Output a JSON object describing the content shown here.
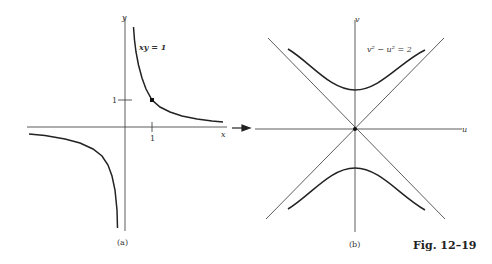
{
  "figure": {
    "label": "Fig. 12–19",
    "panel_a": {
      "caption": "(a)",
      "x_axis_label": "x",
      "y_axis_label": "y",
      "x_tick": "1",
      "y_tick": "1",
      "curve_label": "xy = 1",
      "marked_point": [
        1,
        1
      ]
    },
    "panel_b": {
      "caption": "(b)",
      "u_axis_label": "u",
      "v_axis_label": "v",
      "curve_label": "v² − u² = 2",
      "asymptotes": [
        "v = u",
        "v = −u"
      ]
    },
    "mapping_arrow": "right-arrow"
  }
}
